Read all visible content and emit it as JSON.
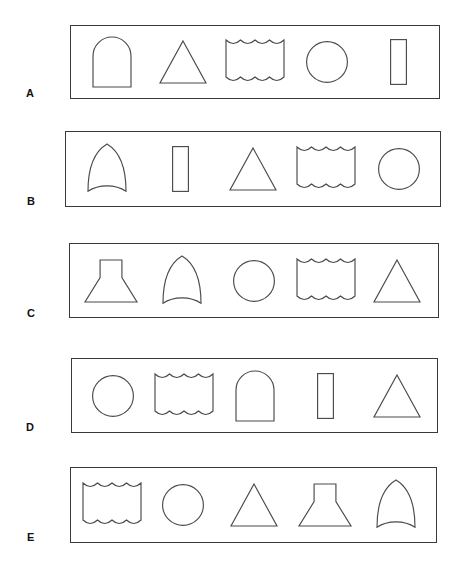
{
  "page": {
    "background_color": "#ffffff",
    "stroke_color": "#4a4a4a",
    "border_color": "#3a3a3a",
    "label_color": "#111111"
  },
  "shape_names": {
    "arch": "round-arch-shape",
    "triangle": "triangle-shape",
    "wavy": "wavy-edged-rectangle-shape",
    "circle": "circle-shape",
    "rect": "vertical-rectangle-shape",
    "gothic": "pointed-arch-shape",
    "funnel": "funnel-trapezoid-shape"
  },
  "rows": [
    {
      "label": "A",
      "box": {
        "x": 70,
        "y": 25,
        "w": 370,
        "h": 74
      },
      "label_pos": {
        "x": 26,
        "y": 88
      },
      "shapes": [
        "arch",
        "triangle",
        "wavy",
        "circle",
        "rect"
      ]
    },
    {
      "label": "B",
      "box": {
        "x": 65,
        "y": 131,
        "w": 376,
        "h": 76
      },
      "label_pos": {
        "x": 27,
        "y": 196
      },
      "shapes": [
        "gothic",
        "rect",
        "triangle",
        "wavy",
        "circle"
      ]
    },
    {
      "label": "C",
      "box": {
        "x": 69,
        "y": 243,
        "w": 370,
        "h": 75
      },
      "label_pos": {
        "x": 27,
        "y": 308
      },
      "shapes": [
        "funnel",
        "gothic",
        "circle",
        "wavy",
        "triangle"
      ]
    },
    {
      "label": "D",
      "box": {
        "x": 71,
        "y": 358,
        "w": 367,
        "h": 75
      },
      "label_pos": {
        "x": 26,
        "y": 422
      },
      "shapes": [
        "circle",
        "wavy",
        "arch",
        "rect",
        "triangle"
      ]
    },
    {
      "label": "E",
      "box": {
        "x": 70,
        "y": 467,
        "w": 367,
        "h": 76
      },
      "label_pos": {
        "x": 27,
        "y": 532
      },
      "shapes": [
        "wavy",
        "circle",
        "triangle",
        "funnel",
        "gothic"
      ]
    }
  ]
}
